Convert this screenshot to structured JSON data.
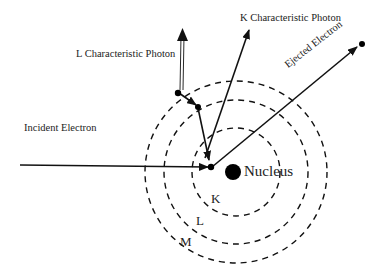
{
  "diagram": {
    "labels": {
      "incident_electron": "Incident Electron",
      "ejected_electron": "Ejected Electron",
      "k_photon": "K Characteristic Photon",
      "l_photon": "L Characteristic Photon",
      "nucleus": "Nucleus",
      "shell_k": "K",
      "shell_l": "L",
      "shell_m": "M"
    },
    "colors": {
      "ink": "#111111",
      "background": "#ffffff"
    }
  }
}
